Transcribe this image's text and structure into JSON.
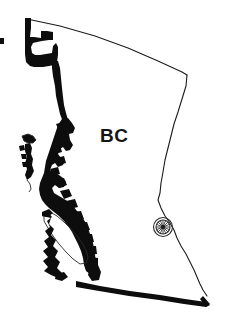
{
  "figure": {
    "kind": "outline-map",
    "background_color": "#ffffff",
    "ink_color": "#0d0d0d",
    "line_color": "#1b1b1b",
    "width": 230,
    "height": 325
  },
  "labels": {
    "region": {
      "text": "BC",
      "x": 100,
      "y": 142,
      "font_size": 19,
      "weight": "bold",
      "color": "#151515"
    }
  },
  "markers": [
    {
      "name": "compass-rose-marker",
      "icon": "compass-rose-icon",
      "x": 163,
      "y": 227,
      "outer_radius": 9.5,
      "inner_radius": 7.0,
      "hub_radius": 1.9,
      "spokes": 16,
      "color": "#2b2b2b"
    }
  ],
  "edge_marks": [
    {
      "name": "left-edge-tick",
      "x": 0,
      "y": 38,
      "width": 4,
      "height": 6,
      "color": "#1a1a1a"
    }
  ],
  "borders": {
    "north": {
      "name": "northern-boundary",
      "style": "thin",
      "description": "60th parallel, thin curved line to Yukon / Northwest Territories"
    },
    "east": {
      "name": "eastern-boundary",
      "style": "thin",
      "description": "Rocky Mountain divide, thin line to Alberta"
    },
    "south": {
      "name": "southern-boundary",
      "style": "thick",
      "description": "49th parallel, heavy black line at United States border"
    },
    "northwest": {
      "name": "alaska-panhandle-boundary",
      "style": "thick-stepped",
      "description": "Heavy stepped black line along Alaska panhandle"
    },
    "west": {
      "name": "pacific-coastline",
      "style": "thick-jagged",
      "description": "Heavy jagged black Pacific coastline with fjords"
    }
  },
  "islands": [
    {
      "name": "haida-gwaii",
      "style": "filled-black",
      "x": 18,
      "y": 136
    },
    {
      "name": "vancouver-island",
      "style": "outline-with-black-coast",
      "x": 45,
      "y": 218
    }
  ]
}
